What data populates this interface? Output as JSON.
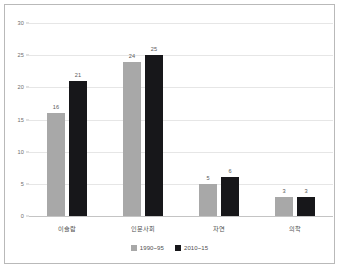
{
  "chart_data": {
    "type": "bar",
    "title": "",
    "xlabel": "",
    "ylabel": "",
    "categories": [
      "이슬람",
      "인문사회",
      "자연",
      "의학"
    ],
    "series": [
      {
        "name": "1990~95",
        "color": "#a8a8a8",
        "values": [
          16,
          24,
          5,
          3
        ]
      },
      {
        "name": "2010~15",
        "color": "#17171a",
        "values": [
          21,
          25,
          6,
          3
        ]
      }
    ],
    "ylim": [
      0,
      30
    ],
    "yticks": [
      0,
      5,
      10,
      15,
      20,
      25,
      30
    ],
    "ytick_labels": [
      "0",
      "5",
      "10",
      "15",
      "20",
      "25",
      "30"
    ],
    "grid": true,
    "legend_position": "bottom",
    "data_labels": true
  },
  "colors": {
    "series_1990": "#a8a8a8",
    "series_2010": "#17171a",
    "gridline": "#e6e6e6",
    "axis": "#c4c4c4",
    "frame": "#b9b9b9",
    "text": "#4f4f4f",
    "background": "#ffffff"
  }
}
